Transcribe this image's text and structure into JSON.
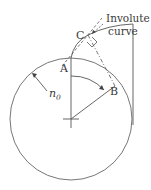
{
  "diagram": {
    "labels": {
      "point_a": "A",
      "point_b": "B",
      "point_c": "C",
      "involute_line1": "Involute",
      "involute_line2": "curve",
      "radius_symbol": "n",
      "radius_subscript": "0"
    },
    "colors": {
      "stroke": "#555555",
      "text": "#3a3a3a",
      "background": "#ffffff"
    }
  }
}
